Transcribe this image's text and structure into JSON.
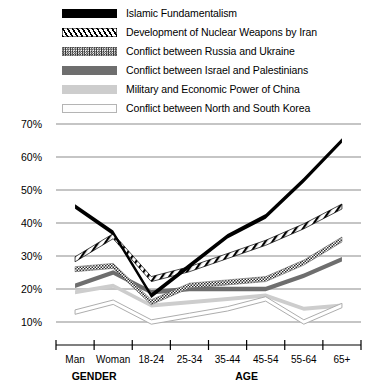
{
  "chart_data": {
    "type": "line",
    "title": "",
    "xlabel": "",
    "ylabel": "",
    "ylim": [
      5,
      72
    ],
    "yticks": [
      10,
      20,
      30,
      40,
      50,
      60,
      70
    ],
    "ytick_labels": [
      "10%",
      "20%",
      "30%",
      "40%",
      "50%",
      "60%",
      "70%"
    ],
    "grid": true,
    "legend_position": "top-left",
    "categories": [
      "Man",
      "Woman",
      "18-24",
      "25-34",
      "35-44",
      "45-54",
      "55-64",
      "65+"
    ],
    "category_groups": [
      {
        "label": "GENDER",
        "categories": [
          "Man",
          "Woman"
        ]
      },
      {
        "label": "AGE",
        "categories": [
          "18-24",
          "25-34",
          "35-44",
          "45-54",
          "55-64",
          "65+"
        ]
      }
    ],
    "series": [
      {
        "name": "Islamic Fundamentalism",
        "style": "solid-black",
        "color": "#000000",
        "values": [
          45,
          37,
          18,
          27,
          36,
          42,
          53,
          65
        ]
      },
      {
        "name": "Development of Nuclear Weapons by Iran",
        "style": "diagonal-hatch",
        "color": "#000000",
        "values": [
          29,
          36,
          23,
          26,
          30,
          34,
          39,
          45
        ]
      },
      {
        "name": "Conflict between Russia and  Ukraine",
        "style": "checkered",
        "color": "#2b2b2b",
        "values": [
          26,
          27,
          16,
          21,
          22,
          23,
          28,
          35
        ]
      },
      {
        "name": "Conflict between Israel and  Palestinians",
        "style": "solid-gray",
        "color": "#6e6e6e",
        "values": [
          21,
          25,
          19,
          20,
          20,
          20,
          24,
          29
        ]
      },
      {
        "name": "Military and Economic Power of China",
        "style": "light-gray",
        "color": "#cdcdcd",
        "values": [
          19,
          21,
          15,
          16,
          17,
          18,
          14,
          15
        ]
      },
      {
        "name": "Conflict between North and South Korea",
        "style": "outline-white",
        "color": "#ffffff",
        "values": [
          13,
          16,
          10,
          12,
          14,
          17,
          10,
          15
        ]
      }
    ]
  },
  "legend": {
    "items": [
      {
        "label": "Islamic Fundamentalism",
        "swatch": "f-islamic"
      },
      {
        "label": "Development of Nuclear Weapons by Iran",
        "swatch": "f-iran"
      },
      {
        "label": "Conflict between Russia and  Ukraine",
        "swatch": "f-russia"
      },
      {
        "label": "Conflict between Israel and  Palestinians",
        "swatch": "f-israel"
      },
      {
        "label": "Military and Economic Power of China",
        "swatch": "f-china"
      },
      {
        "label": "Conflict between North and South Korea",
        "swatch": "f-korea"
      }
    ]
  }
}
